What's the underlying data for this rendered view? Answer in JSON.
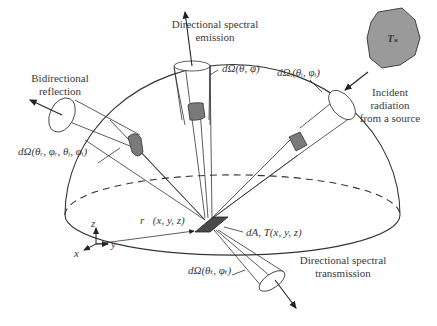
{
  "figure": {
    "labels": {
      "emission": [
        "Directional spectral",
        "emission"
      ],
      "reflection": [
        "Bidirectional",
        "reflection"
      ],
      "incident": [
        "Incident",
        "radiation",
        "from a source"
      ],
      "transmission": [
        "Directional spectral",
        "transmission"
      ],
      "solid_angle_emission": "dΩ(θ, φ)",
      "solid_angle_incident": "dΩᵢ(θᵢ, φᵢ)",
      "solid_angle_reflection": "dΩ(θᵣ, φᵣ, θᵢ, φᵢ)",
      "solid_angle_transmission": "dΩ(θₜ, φₜ)",
      "area_element": "dA, T(x, y, z)",
      "position_vector": "r⃗(x, y, z)",
      "source_temperature": "Tₛ",
      "axis_x": "x",
      "axis_y": "y",
      "axis_z": "z"
    },
    "colors": {
      "line": "#333333",
      "patch_fill": "#7a7a7a",
      "area_fill": "#4a4a4a",
      "source_fill": "#9a9a9a",
      "background": "#ffffff"
    }
  }
}
